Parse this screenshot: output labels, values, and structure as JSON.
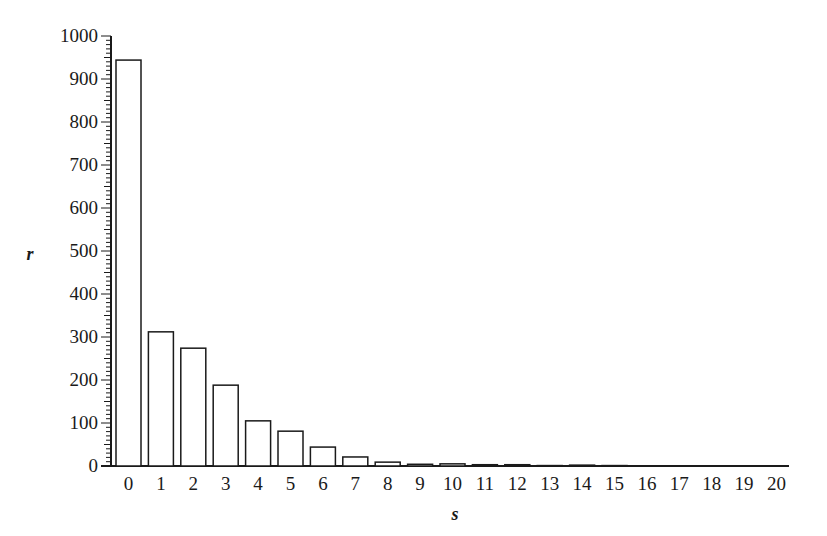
{
  "chart_data": {
    "type": "bar",
    "title": "",
    "xlabel": "s",
    "ylabel": "r",
    "categories": [
      "0",
      "1",
      "2",
      "3",
      "4",
      "5",
      "6",
      "7",
      "8",
      "9",
      "10",
      "11",
      "12",
      "13",
      "14",
      "15",
      "16",
      "17",
      "18",
      "19",
      "20"
    ],
    "values": [
      944,
      312,
      274,
      188,
      105,
      81,
      44,
      21,
      9,
      4,
      5,
      3,
      3,
      1,
      2,
      1,
      0,
      0,
      0,
      0,
      0
    ],
    "ylim": [
      0,
      1000
    ],
    "yticks": [
      0,
      100,
      200,
      300,
      400,
      500,
      600,
      700,
      800,
      900,
      1000
    ],
    "yminor_step": 10,
    "grid": false,
    "legend": null,
    "bar_fill": "#ffffff",
    "bar_stroke": "#1a1a1a"
  }
}
